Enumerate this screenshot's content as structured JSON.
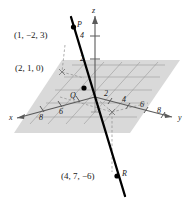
{
  "figure": {
    "type": "3d-coordinate-diagram",
    "background_color": "#ffffff",
    "plane_color": "#d9d9d9",
    "line_color": "#000000",
    "grid_color": "#8c8c8c",
    "axis_color": "#6e6e6e"
  },
  "axes": {
    "x": {
      "label": "x",
      "ticks": [
        "8",
        "6"
      ]
    },
    "y": {
      "label": "y",
      "ticks": [
        "2",
        "4",
        "6",
        "8"
      ]
    },
    "z": {
      "label": "z",
      "ticks": [
        "2",
        "4"
      ]
    }
  },
  "points": [
    {
      "name": "P",
      "coords": "(1, −2, 3)"
    },
    {
      "name": "Q",
      "coords": "(2, 1, 0)"
    },
    {
      "name": "R",
      "coords": "(4, 7, −6)"
    }
  ],
  "labels": {
    "p_coords": "(1, −2, 3)",
    "p_name": "P",
    "q_coords": "(2, 1, 0)",
    "q_name": "Q",
    "r_coords": "(4, 7, −6)",
    "r_name": "R",
    "x_axis": "x",
    "y_axis": "y",
    "z_axis": "z",
    "x_tick_8": "8",
    "x_tick_6": "6",
    "y_tick_2": "2",
    "y_tick_4": "4",
    "y_tick_6": "6",
    "y_tick_8": "8",
    "z_tick_2": "2",
    "z_tick_4": "4"
  }
}
